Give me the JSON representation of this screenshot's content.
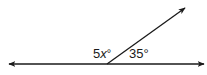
{
  "diagram": {
    "type": "angle-pair-on-line",
    "line_color": "#1a1a1a",
    "angles": [
      {
        "coefficient": "5",
        "variable": "x",
        "degree": "°",
        "position": "left"
      },
      {
        "value": "35°",
        "position": "right"
      }
    ]
  }
}
